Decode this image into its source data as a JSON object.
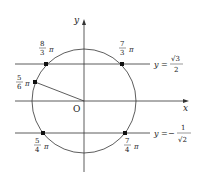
{
  "diagram": {
    "type": "unit-circle",
    "axes": {
      "x_label": "x",
      "y_label": "y",
      "origin_label": "O"
    },
    "lines": [
      {
        "id": "upper",
        "label_lhs": "y",
        "label_eq": "=",
        "label_num": "√3",
        "label_den": "2",
        "label_sign": ""
      },
      {
        "id": "lower",
        "label_lhs": "y",
        "label_eq": "=",
        "label_num": "1",
        "label_den": "√2",
        "label_sign": "−"
      }
    ],
    "points": [
      {
        "id": "p-8-3",
        "num": "8",
        "den": "3",
        "pi": "π"
      },
      {
        "id": "p-7-3",
        "num": "7",
        "den": "3",
        "pi": "π"
      },
      {
        "id": "p-5-6",
        "num": "5",
        "den": "6",
        "pi": "π"
      },
      {
        "id": "p-5-4",
        "num": "5",
        "den": "4",
        "pi": "π"
      },
      {
        "id": "p-7-4",
        "num": "7",
        "den": "4",
        "pi": "π"
      }
    ],
    "colors": {
      "stroke": "#333333",
      "text": "#222222",
      "background": "#ffffff"
    }
  }
}
